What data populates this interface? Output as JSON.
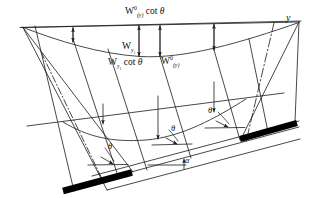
{
  "figure": {
    "kind": "subsidence-profile-diagram",
    "background_color": "#ffffff",
    "line_color": "#1a1a1a",
    "seam_color": "#000000",
    "width": 309,
    "height": 198
  },
  "labels": {
    "top_width": {
      "base": "W",
      "sup": "0",
      "sub": "(y)",
      "suffix": "cot θ",
      "text": "W⁰₍ᵧ₎ cot θ"
    },
    "w_y1": {
      "base": "W",
      "sub": "y₁",
      "text": "Wᵧ₁"
    },
    "w_y1_cot": {
      "base": "W",
      "sub": "y₁",
      "suffix": "cot θ",
      "text": "Wᵧ₁ cot θ"
    },
    "w0_y": {
      "base": "W",
      "sup": "0",
      "sub": "(y)",
      "text": "W⁰₍ᵧ₎"
    },
    "y_axis": "y",
    "theta_right": "θ",
    "theta_middle": "θ",
    "theta_left": "θ",
    "alpha": "α"
  },
  "geometry": {
    "surface_line": {
      "x1": 22,
      "y1": 27,
      "x2": 300,
      "y2": 21
    },
    "surface_trough": "M22,27 C70,45 120,57 160,56 C210,54 255,38 297,23",
    "mid_line": {
      "x1": 27,
      "y1": 125,
      "x2": 282,
      "y2": 94
    },
    "mid_trough": "M64,122 C92,139 118,142 150,139 C185,136 215,120 244,100",
    "seam_left": {
      "x1": 63,
      "y1": 191,
      "x2": 131,
      "y2": 172
    },
    "seam_right": {
      "x1": 239,
      "y1": 138,
      "x2": 296,
      "y2": 122
    },
    "seam_thickness": 6,
    "dashdot_vertical": {
      "x1": 272,
      "y1": 24,
      "x2": 245,
      "y2": 142
    },
    "arrow_count_top": 4,
    "arrow_count_mid": 2
  }
}
